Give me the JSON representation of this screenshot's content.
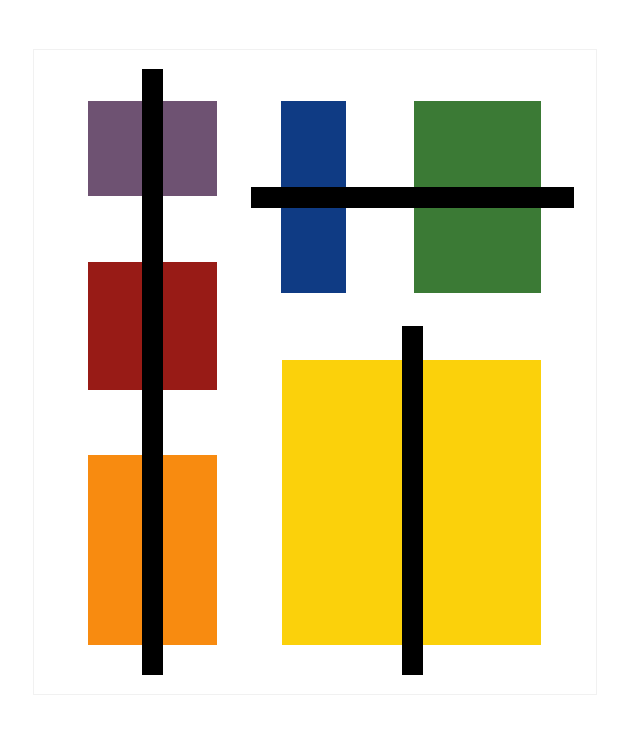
{
  "artwork": {
    "background": "#ffffff",
    "frame": {
      "x": 33,
      "y": 49,
      "w": 564,
      "h": 646,
      "border": "#f1f1f1"
    },
    "blocks": [
      {
        "name": "purple-block",
        "color": "#6e5272",
        "x": 88,
        "y": 101,
        "w": 129,
        "h": 95
      },
      {
        "name": "blue-block",
        "color": "#0f3b84",
        "x": 281,
        "y": 101,
        "w": 65,
        "h": 192
      },
      {
        "name": "green-block",
        "color": "#3b7a35",
        "x": 414,
        "y": 101,
        "w": 127,
        "h": 192
      },
      {
        "name": "red-block",
        "color": "#981b16",
        "x": 88,
        "y": 262,
        "w": 129,
        "h": 128
      },
      {
        "name": "yellow-block",
        "color": "#fbd10b",
        "x": 282,
        "y": 360,
        "w": 259,
        "h": 285
      },
      {
        "name": "orange-block",
        "color": "#f88b10",
        "x": 88,
        "y": 455,
        "w": 129,
        "h": 190
      }
    ],
    "bars": [
      {
        "name": "left-vertical-bar",
        "color": "#000000",
        "x": 142,
        "y": 69,
        "w": 21,
        "h": 606
      },
      {
        "name": "top-horizontal-bar",
        "color": "#000000",
        "x": 251,
        "y": 187,
        "w": 323,
        "h": 21
      },
      {
        "name": "right-vertical-bar",
        "color": "#000000",
        "x": 402,
        "y": 326,
        "w": 21,
        "h": 349
      }
    ]
  }
}
